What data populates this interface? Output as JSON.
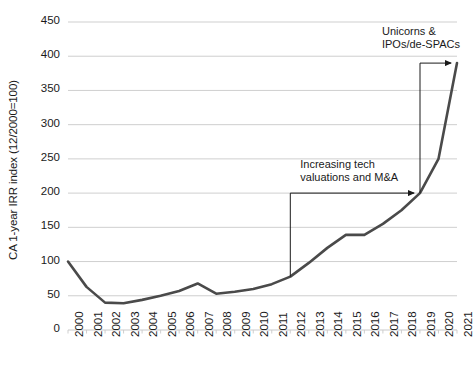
{
  "chart_data": {
    "type": "line",
    "title": "",
    "subtitle": "",
    "xlabel": "",
    "ylabel": "CA 1-year IRR index (12/2000=100)",
    "ylim": [
      0,
      450
    ],
    "ytick_values": [
      0,
      50,
      100,
      150,
      200,
      250,
      300,
      350,
      400,
      450
    ],
    "ytick_labels": [
      "0",
      "50",
      "100",
      "150",
      "200",
      "250",
      "300",
      "350",
      "400",
      "450"
    ],
    "grid": true,
    "grid_axis": "y",
    "legend": false,
    "legend_position": "none",
    "categories": [
      "2000",
      "2001",
      "2002",
      "2003",
      "2004",
      "2005",
      "2006",
      "2007",
      "2008",
      "2009",
      "2010",
      "2011",
      "2012",
      "2013",
      "2014",
      "2015",
      "2016",
      "2017",
      "2018",
      "2019",
      "2020",
      "2021"
    ],
    "x": [
      2000,
      2001,
      2002,
      2003,
      2004,
      2005,
      2006,
      2007,
      2008,
      2009,
      2010,
      2011,
      2012,
      2013,
      2014,
      2015,
      2016,
      2017,
      2018,
      2019,
      2020,
      2021
    ],
    "values": [
      100,
      63,
      40,
      39,
      44,
      50,
      57,
      68,
      53,
      56,
      60,
      67,
      78,
      98,
      120,
      139,
      139,
      155,
      175,
      200,
      250,
      390
    ],
    "series": [
      {
        "name": "CA 1-year IRR index",
        "color": "#4a4a4a",
        "values": [
          100,
          63,
          40,
          39,
          44,
          50,
          57,
          68,
          53,
          56,
          60,
          67,
          78,
          98,
          120,
          139,
          139,
          155,
          175,
          200,
          250,
          390
        ]
      }
    ],
    "annotations": [
      {
        "id": "annotation-tech-valuations",
        "text_lines": [
          "Increasing tech",
          "valuations and M&A"
        ],
        "span_start_year": 2012,
        "span_end_year": 2019,
        "bracket_level": 200
      },
      {
        "id": "annotation-unicorns",
        "text_lines": [
          "Unicorns &",
          "IPOs/de-SPACs"
        ],
        "span_start_year": 2019,
        "span_end_year": 2021,
        "bracket_level": 390
      }
    ]
  },
  "axis": {
    "y_label": "CA 1-year IRR index (12/2000=100)",
    "y_ticks": [
      "450",
      "400",
      "350",
      "300",
      "250",
      "200",
      "150",
      "100",
      "50",
      "0"
    ],
    "x_ticks": [
      "2000",
      "2001",
      "2002",
      "2003",
      "2004",
      "2005",
      "2006",
      "2007",
      "2008",
      "2009",
      "2010",
      "2011",
      "2012",
      "2013",
      "2014",
      "2015",
      "2016",
      "2017",
      "2018",
      "2019",
      "2020",
      "2021"
    ]
  },
  "annotations": {
    "tech": {
      "line1": "Increasing tech",
      "line2": "valuations and M&A"
    },
    "unicorns": {
      "line1": "Unicorns &",
      "line2": "IPOs/de-SPACs"
    }
  },
  "colors": {
    "line": "#4a4a4a",
    "grid": "#c9c9c9",
    "text": "#1a1a1a",
    "background": "#ffffff"
  }
}
